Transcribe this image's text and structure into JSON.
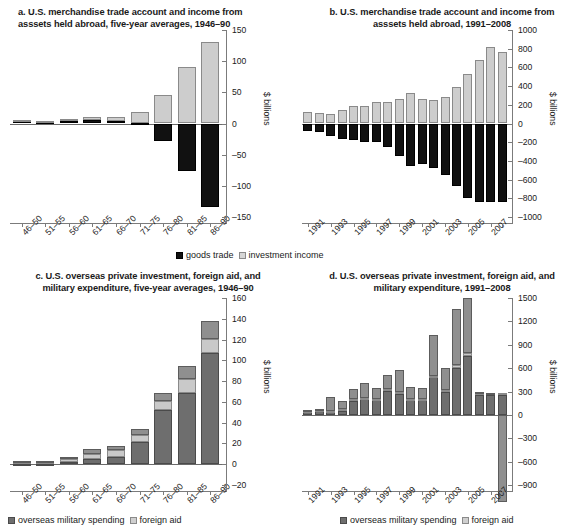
{
  "figure": {
    "units_label": "$ billions",
    "legend_ab": {
      "goods": "goods trade",
      "invest": "investment income"
    },
    "legend_cd": {
      "military": "overseas military spending",
      "aid": "foreign aid"
    }
  },
  "chart_data": [
    {
      "id": "a",
      "type": "bar",
      "stacked": true,
      "title": "a. U.S. merchandise trade account and income from asssets held abroad, five-year averages, 1946–90",
      "title_line1": "a. U.S. merchandise trade account and income from",
      "title_line2": "asssets held abroad, five-year averages, 1946–90",
      "xlabel": "",
      "ylabel": "$ billions",
      "ylim": [
        -150,
        150
      ],
      "yticks": [
        150,
        100,
        50,
        0,
        -50,
        -100,
        -150
      ],
      "ytick_labels": [
        "150",
        "100",
        "50",
        "0",
        "–50",
        "–100",
        "–150"
      ],
      "grid": false,
      "legend_position": "bottom",
      "categories": [
        "46–50",
        "51–55",
        "56–60",
        "61–65",
        "66–70",
        "71–75",
        "76–80",
        "81–85",
        "86–90"
      ],
      "series": [
        {
          "name": "goods trade",
          "color": "#111111",
          "values": [
            4,
            2,
            4,
            5,
            4,
            1,
            -28,
            -76,
            -134
          ]
        },
        {
          "name": "investment income",
          "color": "#cdcdcd",
          "values": [
            2,
            2,
            3,
            5,
            6,
            17,
            45,
            91,
            130
          ]
        }
      ]
    },
    {
      "id": "b",
      "type": "bar",
      "stacked": true,
      "title": "b. U.S. merchandise trade account and income from asssets held abroad, 1991–2008",
      "title_line1": "b. U.S. merchandise trade account and income from",
      "title_line2": "asssets held abroad, 1991–2008",
      "xlabel": "",
      "ylabel": "$ billions",
      "ylim": [
        -1000,
        1000
      ],
      "yticks": [
        1000,
        800,
        600,
        400,
        200,
        0,
        -200,
        -400,
        -600,
        -800,
        -1000
      ],
      "ytick_labels": [
        "1000",
        "800",
        "600",
        "400",
        "200",
        "0",
        "–200",
        "–400",
        "–600",
        "–800",
        "–1000"
      ],
      "grid": false,
      "legend_position": "bottom",
      "categories": [
        "1991",
        "1992",
        "1993",
        "1994",
        "1995",
        "1996",
        "1997",
        "1998",
        "1999",
        "2000",
        "2001",
        "2002",
        "2003",
        "2004",
        "2005",
        "2006",
        "2007",
        "2008"
      ],
      "xtick_labels_shown": [
        "1991",
        "1993",
        "1995",
        "1997",
        "1999",
        "2001",
        "2003",
        "2005",
        "2007"
      ],
      "series": [
        {
          "name": "goods trade",
          "color": "#111111",
          "values": [
            -75,
            -95,
            -135,
            -170,
            -175,
            -195,
            -200,
            -250,
            -350,
            -455,
            -430,
            -480,
            -550,
            -670,
            -800,
            -840,
            -835,
            -835
          ]
        },
        {
          "name": "investment income",
          "color": "#cdcdcd",
          "values": [
            120,
            110,
            105,
            140,
            185,
            190,
            225,
            230,
            265,
            325,
            265,
            255,
            285,
            390,
            530,
            675,
            815,
            760
          ]
        }
      ]
    },
    {
      "id": "c",
      "type": "bar",
      "stacked": true,
      "title": "c. U.S. overseas private investment, foreign aid, and military expenditure, five-year averages, 1946–90",
      "title_line1": "c. U.S. overseas private investment, foreign aid, and",
      "title_line2": "military expenditure, five-year averages, 1946–90",
      "xlabel": "",
      "ylabel": "$ billions",
      "ylim": [
        -20,
        160
      ],
      "yticks": [
        160,
        140,
        120,
        100,
        80,
        60,
        40,
        20,
        0,
        -20
      ],
      "ytick_labels": [
        "160",
        "140",
        "120",
        "100",
        "80",
        "60",
        "40",
        "20",
        "0",
        "–20"
      ],
      "grid": false,
      "legend_position": "bottom",
      "categories": [
        "46–50",
        "51–55",
        "56–60",
        "61–65",
        "66–70",
        "71–75",
        "76–80",
        "81–85",
        "86–90"
      ],
      "series": [
        {
          "name": "overseas military spending",
          "color": "#6e6e6e",
          "values": [
            0.5,
            0.5,
            2.5,
            5,
            6.5,
            21,
            52,
            69,
            107
          ]
        },
        {
          "name": "foreign aid",
          "color": "#c9c9c9",
          "values": [
            2.5,
            2.5,
            2.5,
            5,
            7.5,
            7,
            9,
            13,
            14
          ]
        },
        {
          "name": "overseas private investment",
          "color": "#8f8f8f",
          "values": [
            0.5,
            0.5,
            1.5,
            4.5,
            3.5,
            6,
            8,
            13,
            17
          ]
        }
      ]
    },
    {
      "id": "d",
      "type": "bar",
      "stacked": true,
      "title": "d. U.S. overseas private investment, foreign aid, and military expenditure, 1991–2008",
      "title_line1": "d. U.S. overseas private investment, foreign aid, and",
      "title_line2": "military expenditure, 1991–2008",
      "xlabel": "",
      "ylabel": "$ billions",
      "ylim": [
        -900,
        1500
      ],
      "yticks": [
        1500,
        1200,
        900,
        600,
        300,
        0,
        -300,
        -600,
        -900
      ],
      "ytick_labels": [
        "1500",
        "1200",
        "900",
        "600",
        "300",
        "0",
        "–300",
        "–600",
        "–900"
      ],
      "grid": false,
      "legend_position": "bottom",
      "categories": [
        "1991",
        "1992",
        "1993",
        "1994",
        "1995",
        "1996",
        "1997",
        "1998",
        "1999",
        "2000",
        "2001",
        "2002",
        "2003",
        "2004",
        "2005",
        "2006",
        "2007",
        "2008"
      ],
      "xtick_labels_shown": [
        "1991",
        "1993",
        "1995",
        "1997",
        "1999",
        "2001",
        "2003",
        "2005",
        "2007"
      ],
      "series": [
        {
          "name": "overseas military spending",
          "color": "#6e6e6e",
          "values": [
            40,
            45,
            40,
            55,
            180,
            200,
            185,
            310,
            270,
            190,
            185,
            480,
            290,
            605,
            760,
            255,
            250,
            250
          ]
        },
        {
          "name": "foreign aid",
          "color": "#c9c9c9",
          "values": [
            15,
            15,
            15,
            15,
            20,
            20,
            20,
            20,
            20,
            20,
            25,
            25,
            30,
            30,
            30,
            30,
            30,
            30
          ]
        },
        {
          "name": "overseas private investment",
          "color": "#8f8f8f",
          "values": [
            5,
            15,
            170,
            105,
            135,
            190,
            145,
            185,
            290,
            145,
            135,
            525,
            280,
            725,
            715,
            5,
            5,
            -1120
          ]
        }
      ]
    }
  ]
}
